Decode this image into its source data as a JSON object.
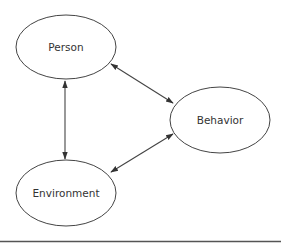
{
  "diagram": {
    "type": "triadic-reciprocal-model",
    "colors": {
      "background": "#ffffff",
      "stroke": "#444444",
      "text": "#333333",
      "rule": "#555555"
    },
    "nodes": [
      {
        "id": "person",
        "label": "Person",
        "cx": 66,
        "cy": 47,
        "rx": 50,
        "ry": 32
      },
      {
        "id": "behavior",
        "label": "Behavior",
        "cx": 220,
        "cy": 120,
        "rx": 50,
        "ry": 33
      },
      {
        "id": "environment",
        "label": "Environment",
        "cx": 66,
        "cy": 193,
        "rx": 50,
        "ry": 33
      }
    ],
    "edges": [
      {
        "from": "person",
        "to": "environment",
        "direction": "bidirectional",
        "x1": 65,
        "y1": 81,
        "x2": 65,
        "y2": 159
      },
      {
        "from": "person",
        "to": "behavior",
        "direction": "bidirectional",
        "x1": 111,
        "y1": 64,
        "x2": 173,
        "y2": 103
      },
      {
        "from": "behavior",
        "to": "environment",
        "direction": "bidirectional",
        "x1": 173,
        "y1": 134,
        "x2": 111,
        "y2": 172
      }
    ],
    "bottom_rule": {
      "x1": 0,
      "y1": 241.5,
      "x2": 281,
      "y2": 241.5
    }
  }
}
